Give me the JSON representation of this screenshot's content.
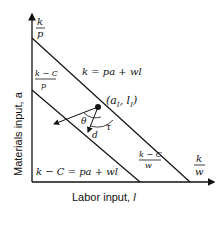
{
  "diagram": {
    "axes": {
      "x_label": "Labor input, ",
      "x_var": "l",
      "y_label": "Materials input, a"
    },
    "y_intercepts": {
      "outer": {
        "num": "k",
        "den": "p"
      },
      "inner": {
        "num": "k − C",
        "den": "p"
      }
    },
    "x_intercepts": {
      "outer": {
        "num": "k",
        "den": "w"
      },
      "inner": {
        "num": "k − C",
        "den": "w"
      }
    },
    "line_labels": {
      "outer": "k = pa + wl",
      "inner": "k − C = pa + wl"
    },
    "point_label": "(a",
    "point_sub_a": "I",
    "point_mid": ", l",
    "point_sub_l": "I",
    "point_close": ")",
    "angles": {
      "theta": "θ",
      "tau": "τ"
    },
    "vector_label": "d",
    "colors": {
      "ink": "#111111",
      "background": "#ffffff"
    }
  }
}
